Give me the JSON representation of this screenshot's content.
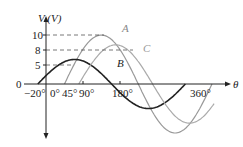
{
  "chart_data": {
    "type": "line",
    "title": "",
    "xlabel": "θ",
    "ylabel": "V (V)",
    "x_ticks": [
      "-20°",
      "0°",
      "45°",
      "90°",
      "180°",
      "360°"
    ],
    "y_ticks": [
      "0",
      "5",
      "8",
      "10"
    ],
    "series": [
      {
        "name": "A",
        "amplitude": 10,
        "phase_deg": 45,
        "color": "#999999",
        "label_pos": [
          125,
          32
        ]
      },
      {
        "name": "B",
        "amplitude": 5,
        "phase_deg": -20,
        "color": "#222222",
        "label_pos": [
          118,
          66
        ]
      },
      {
        "name": "C",
        "amplitude": 8,
        "phase_deg": 80,
        "color": "#aaaaaa",
        "label_pos": [
          143,
          50
        ]
      }
    ],
    "grid": false,
    "legend": "inline labels"
  },
  "labels": {
    "y_axis": "V (V)",
    "x_axis": "θ",
    "origin": "0",
    "t_m20": "−20°",
    "t_0": "0°",
    "t_45": "45°",
    "t_90": "90°",
    "t_180": "180°",
    "t_360": "360°",
    "y10": "10",
    "y8": "8",
    "y5": "5",
    "A": "A",
    "B": "B",
    "C": "C"
  }
}
